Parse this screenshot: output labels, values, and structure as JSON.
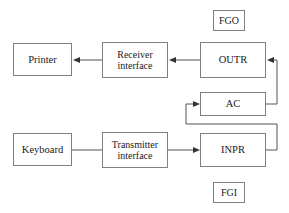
{
  "diagram": {
    "canvas": {
      "width": 289,
      "height": 213
    },
    "style": {
      "box_border_color": "#808080",
      "box_fill_color": "#ffffff",
      "line_color": "#555555",
      "text_color": "#1a1a1a",
      "background": "#ffffff"
    },
    "nodes": [
      {
        "id": "fgo",
        "label": "FGO",
        "x": 213,
        "y": 10,
        "w": 32,
        "h": 21
      },
      {
        "id": "printer",
        "label": "Printer",
        "x": 13,
        "y": 43,
        "w": 59,
        "h": 33
      },
      {
        "id": "receiver",
        "label": "Receiver\ninterface",
        "x": 102,
        "y": 42,
        "w": 66,
        "h": 36
      },
      {
        "id": "outr",
        "label": "OUTR",
        "x": 200,
        "y": 42,
        "w": 66,
        "h": 36
      },
      {
        "id": "ac",
        "label": "AC",
        "x": 200,
        "y": 92,
        "w": 66,
        "h": 24
      },
      {
        "id": "keyboard",
        "label": "Keyboard",
        "x": 13,
        "y": 133,
        "w": 59,
        "h": 33
      },
      {
        "id": "transmitter",
        "label": "Transmitter\ninterface",
        "x": 102,
        "y": 132,
        "w": 66,
        "h": 36
      },
      {
        "id": "inpr",
        "label": "INPR",
        "x": 200,
        "y": 133,
        "w": 66,
        "h": 34
      },
      {
        "id": "fgi",
        "label": "FGI",
        "x": 213,
        "y": 182,
        "w": 32,
        "h": 21
      }
    ],
    "connections": [
      {
        "id": "receiver-to-printer",
        "from": "receiver",
        "to": "printer",
        "arrow": true,
        "direction": "left"
      },
      {
        "id": "outr-to-receiver",
        "from": "outr",
        "to": "receiver",
        "arrow": true,
        "direction": "left"
      },
      {
        "id": "ac-to-outr",
        "from": "ac",
        "to": "outr",
        "arrow": true,
        "direction": "routed-right-up"
      },
      {
        "id": "inpr-to-ac",
        "from": "inpr",
        "to": "ac",
        "arrow": true,
        "direction": "routed-right-up-left-up"
      },
      {
        "id": "keyboard-to-transmitter",
        "from": "keyboard",
        "to": "transmitter",
        "arrow": false,
        "direction": "right"
      },
      {
        "id": "transmitter-to-inpr",
        "from": "transmitter",
        "to": "inpr",
        "arrow": true,
        "direction": "right"
      }
    ]
  }
}
